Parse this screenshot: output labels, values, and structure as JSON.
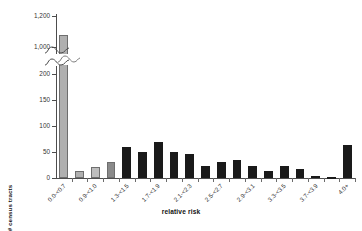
{
  "chart_data": {
    "type": "bar",
    "title": "",
    "xlabel": "relative risk",
    "ylabel": "# census tracts",
    "grid": false,
    "legend": "none",
    "axis_break": {
      "present": true,
      "lower_range": [
        0,
        200
      ],
      "upper_range": [
        1000,
        1200
      ]
    },
    "ylim_lower": [
      0,
      200
    ],
    "ylim_upper": [
      1000,
      1200
    ],
    "ytick_labels_lower": [
      "0",
      "50",
      "100",
      "150",
      "200"
    ],
    "ytick_values_lower": [
      0,
      50,
      100,
      150,
      200
    ],
    "ytick_labels_upper": [
      "1,000",
      "1,200"
    ],
    "ytick_values_upper": [
      1000,
      1200
    ],
    "categories": [
      "0.0-<0.7",
      "0.7-<0.9",
      "0.9-<1.0",
      "1.1-<1.3",
      "1.3-<1.5",
      "1.5-<1.7",
      "1.7-<1.9",
      "1.9-<2.1",
      "2.1-<2.3",
      "2.3-<2.5",
      "2.5-<2.7",
      "2.7-<2.9",
      "2.9-<3.1",
      "3.1-<3.3",
      "3.3-<3.5",
      "3.5-<3.7",
      "3.7-<3.9",
      "3.9-<4.0",
      "4.0+"
    ],
    "tick_label_shown": [
      true,
      false,
      true,
      false,
      true,
      false,
      true,
      false,
      true,
      false,
      true,
      false,
      true,
      false,
      true,
      false,
      true,
      false,
      true
    ],
    "values": [
      1080,
      14,
      22,
      30,
      59,
      50,
      69,
      50,
      46,
      24,
      30,
      35,
      24,
      14,
      24,
      18,
      3,
      2,
      63
    ],
    "bar_colors": [
      "#b0b0b0",
      "#b0b0b0",
      "#bdbdbd",
      "#8a8a8a",
      "#1a1a1a",
      "#1a1a1a",
      "#1a1a1a",
      "#1a1a1a",
      "#1a1a1a",
      "#1a1a1a",
      "#1a1a1a",
      "#1a1a1a",
      "#1a1a1a",
      "#1a1a1a",
      "#1a1a1a",
      "#1a1a1a",
      "#1a1a1a",
      "#1a1a1a",
      "#1a1a1a"
    ]
  }
}
